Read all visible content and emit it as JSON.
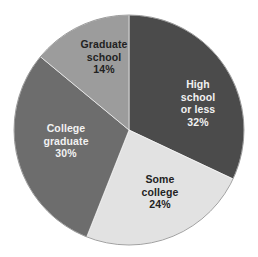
{
  "chart_data": {
    "type": "pie",
    "title": "",
    "start_angle_deg": 0,
    "direction": "clockwise",
    "categories": [
      "High school or less",
      "Some college",
      "College graduate",
      "Graduate school"
    ],
    "values": [
      32,
      24,
      30,
      14
    ],
    "unit": "%",
    "slices": [
      {
        "name": "High school or less",
        "value": 32,
        "label_lines": [
          "High",
          "school",
          "or less",
          "32%"
        ],
        "color": "#4b4b4b",
        "text_color": "#f2f2f2",
        "label_pos": [
          198,
          78
        ]
      },
      {
        "name": "Some college",
        "value": 24,
        "label_lines": [
          "Some",
          "college",
          "24%"
        ],
        "color": "#e2e2e2",
        "text_color": "#222222",
        "label_pos": [
          160,
          173
        ]
      },
      {
        "name": "College graduate",
        "value": 30,
        "label_lines": [
          "College",
          "graduate",
          "30%"
        ],
        "color": "#6d6d6d",
        "text_color": "#f2f2f2",
        "label_pos": [
          66,
          122
        ]
      },
      {
        "name": "Graduate school",
        "value": 14,
        "label_lines": [
          "Graduate",
          "school",
          "14%"
        ],
        "color": "#9c9c9c",
        "text_color": "#222222",
        "label_pos": [
          104,
          38
        ]
      }
    ],
    "legend": null,
    "data_labels": true
  },
  "geometry": {
    "cx": 129,
    "cy": 130,
    "r": 115,
    "outline_color": "#8a8a8a"
  }
}
